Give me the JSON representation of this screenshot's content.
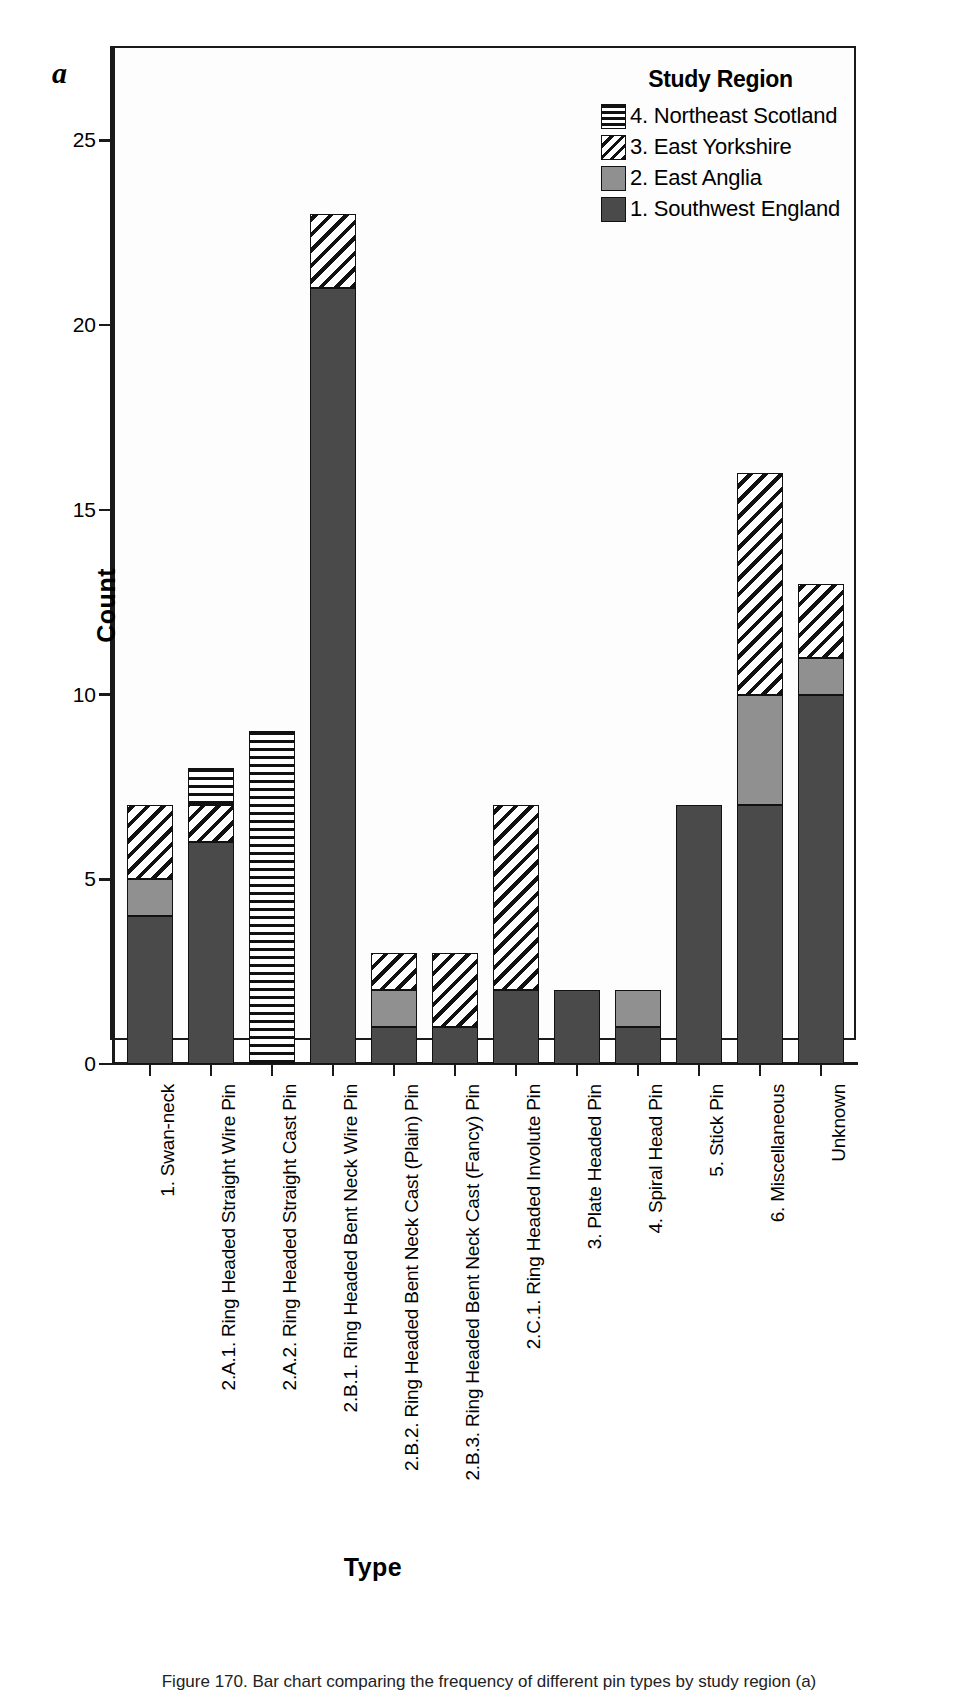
{
  "panel_letter": "a",
  "legend": {
    "title": "Study Region",
    "items": [
      {
        "label": "4. Northeast Scotland",
        "pattern": "horizontal-stripes",
        "color": "#ffffff"
      },
      {
        "label": "3. East Yorkshire",
        "pattern": "diagonal-stripes",
        "color": "#ffffff"
      },
      {
        "label": "2. East Anglia",
        "pattern": "solid",
        "color": "#909090"
      },
      {
        "label": "1. Southwest England",
        "pattern": "solid",
        "color": "#4a4a4a"
      }
    ]
  },
  "chart_data": {
    "type": "bar",
    "subtype": "stacked",
    "title": "",
    "xlabel": "Type",
    "ylabel": "Count",
    "ylim": [
      0,
      27.5
    ],
    "yticks": [
      0,
      5,
      10,
      15,
      20,
      25
    ],
    "ytick_labels": [
      "0",
      "5",
      "10",
      "15",
      "20",
      "25"
    ],
    "grid": false,
    "legend_position": "top-right",
    "legend_title": "Study Region",
    "categories": [
      "1. Swan-neck",
      "2.A.1. Ring Headed Straight Wire Pin",
      "2.A.2. Ring Headed Straight Cast Pin",
      "2.B.1. Ring Headed Bent Neck Wire Pin",
      "2.B.2. Ring Headed Bent Neck Cast (Plain) Pin",
      "2.B.3. Ring Headed Bent Neck Cast (Fancy) Pin",
      "2.C.1. Ring Headed Involute Pin",
      "3. Plate Headed Pin",
      "4. Spiral Head Pin",
      "5. Stick Pin",
      "6. Miscellaneous",
      "Unknown"
    ],
    "series": [
      {
        "name": "1. Southwest England",
        "pattern": "solid",
        "color": "#4a4a4a",
        "values": [
          4,
          6,
          0,
          21,
          1,
          1,
          2,
          2,
          1,
          7,
          7,
          10
        ]
      },
      {
        "name": "2. East Anglia",
        "pattern": "solid",
        "color": "#909090",
        "values": [
          1,
          0,
          0,
          0,
          1,
          0,
          0,
          0,
          1,
          0,
          3,
          1
        ]
      },
      {
        "name": "3. East Yorkshire",
        "pattern": "diagonal-stripes",
        "color": "#ffffff",
        "values": [
          2,
          1,
          0,
          2,
          1,
          2,
          5,
          0,
          0,
          0,
          6,
          2
        ]
      },
      {
        "name": "4. Northeast Scotland",
        "pattern": "horizontal-stripes",
        "color": "#ffffff",
        "values": [
          0,
          1,
          9,
          0,
          0,
          0,
          0,
          0,
          0,
          0,
          0,
          0
        ]
      }
    ],
    "totals": [
      7,
      8,
      9,
      23,
      3,
      3,
      7,
      2,
      2,
      7,
      16,
      13
    ]
  },
  "caption": "Figure 170. Bar chart comparing the frequency of different pin types by study region (a)"
}
